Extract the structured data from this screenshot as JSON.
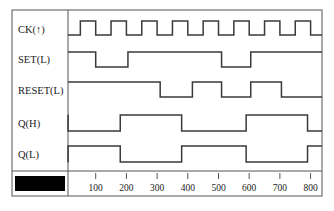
{
  "diagram": {
    "type": "timing",
    "colors": {
      "line": "#3a3a3a",
      "frame": "#555555",
      "background": "#ffffff",
      "redaction": "#000000"
    },
    "signals": [
      {
        "label": "CK(↑)",
        "name": "CK",
        "initial": 0,
        "edges": [
          50,
          100,
          150,
          200,
          250,
          300,
          350,
          400,
          450,
          500,
          550,
          600,
          650,
          700,
          750,
          800
        ]
      },
      {
        "label": "SET(L)",
        "name": "SET",
        "initial": 1,
        "edges": [
          100,
          205,
          510,
          605
        ]
      },
      {
        "label": "RESET(L)",
        "name": "RESET",
        "initial": 1,
        "edges": [
          310,
          415,
          510,
          605,
          705
        ]
      },
      {
        "label": "Q(H)",
        "name": "QH",
        "initial": 1,
        "edges": [
          10,
          180,
          380,
          590,
          790
        ]
      },
      {
        "label": "Q(L)",
        "name": "QL",
        "initial": 0,
        "edges": [
          10,
          180,
          380,
          590,
          790
        ]
      }
    ],
    "time_axis": {
      "ticks": [
        100,
        200,
        300,
        400,
        500,
        600,
        700,
        800
      ],
      "tick_labels": [
        "100",
        "200",
        "300",
        "400",
        "500",
        "600",
        "700",
        "800"
      ],
      "range": [
        0,
        820
      ]
    },
    "redacted_label": ""
  }
}
